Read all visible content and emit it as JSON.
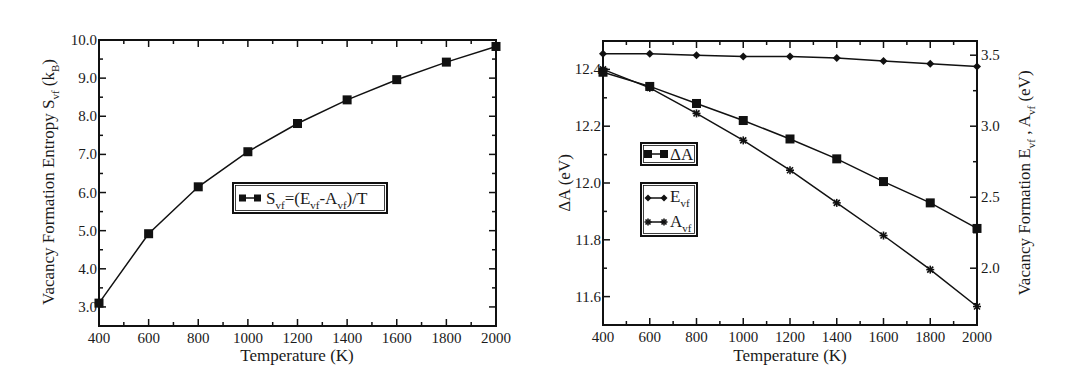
{
  "chart_data": [
    {
      "type": "line",
      "title": "",
      "xlabel": "Temperature (K)",
      "ylabel": "Vacancy Formation Entropy S_vf (k_B)",
      "xlim": [
        400,
        2000
      ],
      "ylim": [
        2.5,
        10.0
      ],
      "xticks": [
        400,
        600,
        800,
        1000,
        1200,
        1400,
        1600,
        1800,
        2000
      ],
      "yticks": [
        3.0,
        4.0,
        5.0,
        6.0,
        7.0,
        8.0,
        9.0,
        10.0
      ],
      "ytick_labels": [
        "3.0",
        "4.0",
        "5.0",
        "6.0",
        "7.0",
        "8.0",
        "9.0",
        "10.0"
      ],
      "grid": false,
      "legend_position": "center",
      "x": [
        400,
        600,
        800,
        1000,
        1200,
        1400,
        1600,
        1800,
        2000
      ],
      "series": [
        {
          "name": "S_vf=(E_vf-A_vf)/T",
          "marker": "square",
          "axis": "left",
          "values": [
            3.1,
            4.92,
            6.15,
            7.07,
            7.81,
            8.43,
            8.96,
            9.42,
            9.83
          ]
        }
      ]
    },
    {
      "type": "line",
      "title": "",
      "xlabel": "Temperature (K)",
      "ylabel": "ΔA (eV)",
      "y2label": "Vacancy Formation E_vf , A_vf (eV)",
      "xlim": [
        400,
        2000
      ],
      "ylim": [
        11.5,
        12.5
      ],
      "y2lim": [
        1.6,
        3.6
      ],
      "xticks": [
        400,
        600,
        800,
        1000,
        1200,
        1400,
        1600,
        1800,
        2000
      ],
      "yticks": [
        11.6,
        11.8,
        12.0,
        12.2,
        12.4
      ],
      "ytick_labels": [
        "11.6",
        "11.8",
        "12.0",
        "12.2",
        "12.4"
      ],
      "y2ticks": [
        2.0,
        2.5,
        3.0,
        3.5
      ],
      "y2tick_labels": [
        "2.0",
        "2.5",
        "3.0",
        "3.5"
      ],
      "grid": false,
      "legend_position": "left-center",
      "x": [
        400,
        600,
        800,
        1000,
        1200,
        1400,
        1600,
        1800,
        2000
      ],
      "series": [
        {
          "name": "ΔA",
          "marker": "square",
          "axis": "left",
          "values": [
            12.39,
            12.34,
            12.28,
            12.22,
            12.155,
            12.085,
            12.005,
            11.93,
            11.84
          ]
        },
        {
          "name": "E_vf",
          "marker": "diamond",
          "axis": "right",
          "values": [
            3.51,
            3.51,
            3.5,
            3.49,
            3.49,
            3.48,
            3.46,
            3.44,
            3.42
          ]
        },
        {
          "name": "A_vf",
          "marker": "star",
          "axis": "right",
          "values": [
            3.4,
            3.27,
            3.09,
            2.9,
            2.69,
            2.46,
            2.23,
            1.99,
            1.73
          ]
        }
      ]
    }
  ],
  "left_chart": {
    "xlabel": "Temperature (K)",
    "ylabel_main": "Vacancy Formation Entropy S",
    "ylabel_sub": "vf",
    "ylabel_paren_open": " (k",
    "ylabel_paren_sub": "B",
    "ylabel_paren_close": ")",
    "legend": {
      "S": "S",
      "S_sub": "vf",
      "eq": "=(E",
      "E_sub": "vf",
      "dash": "-A",
      "A_sub": "vf",
      "tail": ")/T"
    }
  },
  "right_chart": {
    "xlabel": "Temperature (K)",
    "ylabel": "ΔA (eV)",
    "y2label_main": "Vacancy Formation E",
    "y2label_sub1": "vf",
    "y2label_mid": " , A",
    "y2label_sub2": "vf",
    "y2label_tail": " (eV)",
    "legend": {
      "dA": "ΔA",
      "E": "E",
      "E_sub": "vf",
      "A": "A",
      "A_sub": "vf"
    }
  }
}
